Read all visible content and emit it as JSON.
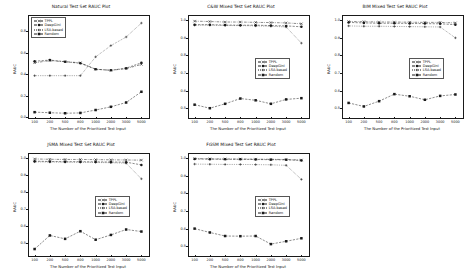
{
  "figure": {
    "panel_count": 5,
    "shared": {
      "xlabel": "The Number of the Prioritized Test Input",
      "ylabel": "RAUC",
      "xticks": [
        "100",
        "200",
        "500",
        "800",
        "1000",
        "2000",
        "3000",
        "5000"
      ],
      "legend": [
        {
          "label": "TPPL",
          "style": "dashdot",
          "marker": "x"
        },
        {
          "label": "DeepGini",
          "style": "dashed",
          "marker": "circle"
        },
        {
          "label": "LSA-based",
          "style": "dotted",
          "marker": "plus"
        },
        {
          "label": "Random",
          "style": "dashed",
          "marker": "square"
        }
      ]
    }
  },
  "chart_data": [
    {
      "type": "line",
      "title": "Natural Test Set RAUC Plot",
      "xlabel": "The Number of the Prioritized Test Input",
      "ylabel": "RAUC",
      "categories": [
        "100",
        "200",
        "500",
        "800",
        "1000",
        "2000",
        "3000",
        "5000"
      ],
      "ylim": [
        0.0,
        0.95
      ],
      "yticks": [
        0.0,
        0.2,
        0.4,
        0.6,
        0.8
      ],
      "ytick_labels": [
        "0.0",
        "0.2",
        "0.4",
        "0.6",
        "0.8"
      ],
      "grid": false,
      "legend_position": "upper-left",
      "series": [
        {
          "name": "TPPL",
          "values": [
            0.505,
            0.525,
            0.515,
            0.505,
            0.445,
            0.435,
            0.45,
            0.49
          ]
        },
        {
          "name": "DeepGini",
          "values": [
            0.52,
            0.53,
            0.515,
            0.5,
            0.445,
            0.435,
            0.455,
            0.505
          ]
        },
        {
          "name": "LSA-based",
          "values": [
            0.385,
            0.385,
            0.385,
            0.385,
            0.56,
            0.665,
            0.745,
            0.875
          ]
        },
        {
          "name": "Random",
          "values": [
            0.045,
            0.04,
            0.035,
            0.038,
            0.065,
            0.095,
            0.135,
            0.235
          ]
        }
      ]
    },
    {
      "type": "line",
      "title": "C&W Mixed Test Set RAUC Plot",
      "xlabel": "The Number of the Prioritized Test Input",
      "ylabel": "RAUC",
      "categories": [
        "100",
        "200",
        "500",
        "800",
        "1000",
        "2000",
        "3000",
        "5000"
      ],
      "ylim": [
        0.45,
        1.03
      ],
      "yticks": [
        0.5,
        0.6,
        0.7,
        0.8,
        0.9,
        1.0
      ],
      "ytick_labels": [
        "0.5",
        "0.6",
        "0.7",
        "0.8",
        "0.9",
        "1.0"
      ],
      "grid": false,
      "legend_position": "center-right",
      "series": [
        {
          "name": "TPPL",
          "values": [
            0.995,
            0.993,
            0.99,
            0.99,
            0.988,
            0.987,
            0.985,
            0.98
          ]
        },
        {
          "name": "DeepGini",
          "values": [
            0.975,
            0.975,
            0.973,
            0.972,
            0.972,
            0.97,
            0.968,
            0.963
          ]
        },
        {
          "name": "LSA-based",
          "values": [
            0.972,
            0.972,
            0.97,
            0.97,
            0.968,
            0.966,
            0.962,
            0.87
          ]
        },
        {
          "name": "Random",
          "values": [
            0.52,
            0.5,
            0.525,
            0.555,
            0.545,
            0.525,
            0.55,
            0.557
          ]
        }
      ]
    },
    {
      "type": "line",
      "title": "BIM Mixed Test Set RAUC Plot",
      "xlabel": "The Number of the Prioritized Test Input",
      "ylabel": "RAUC",
      "categories": [
        "100",
        "200",
        "500",
        "800",
        "1000",
        "2000",
        "3000",
        "5000"
      ],
      "ylim": [
        0.45,
        1.03
      ],
      "yticks": [
        0.5,
        0.6,
        0.7,
        0.8,
        0.9,
        1.0
      ],
      "ytick_labels": [
        "0.5",
        "0.6",
        "0.7",
        "0.8",
        "0.9",
        "1.0"
      ],
      "grid": false,
      "legend_position": "center-right",
      "series": [
        {
          "name": "TPPL",
          "values": [
            0.993,
            0.992,
            0.99,
            0.99,
            0.989,
            0.988,
            0.988,
            0.985
          ]
        },
        {
          "name": "DeepGini",
          "values": [
            0.988,
            0.985,
            0.983,
            0.983,
            0.982,
            0.981,
            0.98,
            0.975
          ]
        },
        {
          "name": "LSA-based",
          "values": [
            0.968,
            0.966,
            0.966,
            0.965,
            0.964,
            0.963,
            0.962,
            0.9
          ]
        },
        {
          "name": "Random",
          "values": [
            0.53,
            0.51,
            0.54,
            0.58,
            0.568,
            0.548,
            0.57,
            0.578
          ]
        }
      ]
    },
    {
      "type": "line",
      "title": "JSMA Mixed Test Set RAUC Plot",
      "xlabel": "The Number of the Prioritized Test Input",
      "ylabel": "RAUC",
      "categories": [
        "100",
        "200",
        "500",
        "800",
        "1000",
        "2000",
        "3000",
        "5000"
      ],
      "ylim": [
        0.43,
        1.03
      ],
      "yticks": [
        0.5,
        0.6,
        0.7,
        0.8,
        0.9,
        1.0
      ],
      "ytick_labels": [
        "0.5",
        "0.6",
        "0.7",
        "0.8",
        "0.9",
        "1.0"
      ],
      "grid": false,
      "legend_position": "center-right",
      "series": [
        {
          "name": "TPPL",
          "values": [
            0.995,
            0.993,
            0.992,
            0.992,
            0.991,
            0.99,
            0.989,
            0.988
          ]
        },
        {
          "name": "DeepGini",
          "values": [
            0.982,
            0.98,
            0.979,
            0.979,
            0.978,
            0.977,
            0.976,
            0.96
          ]
        },
        {
          "name": "LSA-based",
          "values": [
            0.978,
            0.977,
            0.976,
            0.975,
            0.974,
            0.973,
            0.97,
            0.878
          ]
        },
        {
          "name": "Random",
          "values": [
            0.465,
            0.545,
            0.525,
            0.57,
            0.52,
            0.548,
            0.58,
            0.568
          ]
        }
      ]
    },
    {
      "type": "line",
      "title": "FGSM Mixed Test Set RAUC Plot",
      "xlabel": "The Number of the Prioritized Test Input",
      "ylabel": "RAUC",
      "categories": [
        "100",
        "200",
        "500",
        "800",
        "1000",
        "2000",
        "3000",
        "5000"
      ],
      "ylim": [
        0.45,
        1.03
      ],
      "yticks": [
        0.5,
        0.6,
        0.7,
        0.8,
        0.9,
        1.0
      ],
      "ytick_labels": [
        "0.5",
        "0.6",
        "0.7",
        "0.8",
        "0.9",
        "1.0"
      ],
      "grid": false,
      "legend_position": "center-right",
      "series": [
        {
          "name": "TPPL",
          "values": [
            0.998,
            0.997,
            0.996,
            0.996,
            0.995,
            0.994,
            0.993,
            0.99
          ]
        },
        {
          "name": "DeepGini",
          "values": [
            0.996,
            0.995,
            0.994,
            0.994,
            0.993,
            0.992,
            0.991,
            0.988
          ]
        },
        {
          "name": "LSA-based",
          "values": [
            0.967,
            0.966,
            0.965,
            0.965,
            0.964,
            0.963,
            0.96,
            0.88
          ]
        },
        {
          "name": "Random",
          "values": [
            0.6,
            0.578,
            0.558,
            0.557,
            0.558,
            0.512,
            0.528,
            0.545
          ]
        }
      ]
    }
  ]
}
